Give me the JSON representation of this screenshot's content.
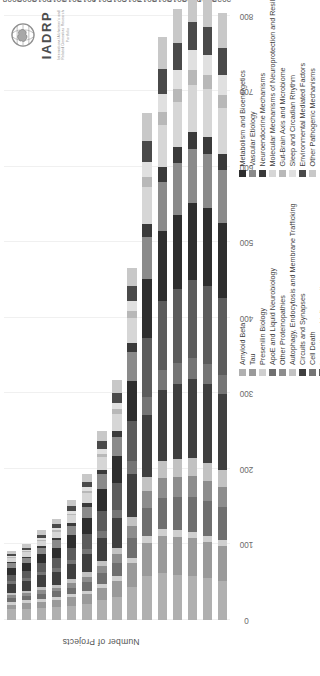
{
  "logo": {
    "name": "IADRP",
    "subtitle": "International Alzheimer's and Related Dementias Research Portfolio",
    "mark": "globe-brain-emblem"
  },
  "chart_data": {
    "type": "bar",
    "orientation": "vertical",
    "stacked": true,
    "title": "",
    "xlabel": "",
    "ylabel": "Number of Projects",
    "ylim": [
      0,
      800
    ],
    "yticks": [
      0,
      100,
      200,
      300,
      400,
      500,
      600,
      700,
      800
    ],
    "grid": true,
    "legend_position": "bottom",
    "categories": [
      "2008",
      "2009",
      "2010",
      "2011",
      "2012",
      "2013",
      "2014",
      "2015",
      "2016",
      "2017",
      "2018",
      "2019",
      "2020",
      "2021",
      "2022"
    ],
    "series": [
      {
        "name": "Amyloid Beta",
        "color": "#b0b0b0",
        "values": [
          14,
          15,
          16,
          17,
          19,
          21,
          26,
          31,
          44,
          58,
          62,
          60,
          58,
          55,
          52
        ]
      },
      {
        "name": "Tau",
        "color": "#9a9a9a",
        "values": [
          6,
          7,
          8,
          9,
          11,
          13,
          17,
          21,
          31,
          44,
          49,
          50,
          50,
          48,
          46
        ]
      },
      {
        "name": "Presenilin Biology",
        "color": "#cfcfcf",
        "values": [
          4,
          4,
          4,
          4,
          4,
          5,
          5,
          6,
          7,
          9,
          9,
          9,
          9,
          8,
          8
        ]
      },
      {
        "name": "ApoE and Liquid Neurobiology",
        "color": "#6f6f6f",
        "values": [
          5,
          6,
          7,
          8,
          9,
          11,
          14,
          18,
          26,
          37,
          42,
          44,
          46,
          46,
          44
        ]
      },
      {
        "name": "Other Proteinopathies",
        "color": "#8d8d8d",
        "values": [
          4,
          4,
          5,
          5,
          6,
          7,
          9,
          11,
          16,
          23,
          26,
          27,
          28,
          27,
          26
        ]
      },
      {
        "name": "Autophagy, Endocytosis and Membrane Trafficking",
        "color": "#c2c2c2",
        "values": [
          3,
          3,
          4,
          4,
          5,
          6,
          7,
          9,
          13,
          19,
          22,
          23,
          24,
          24,
          23
        ]
      },
      {
        "name": "Circuits and Synapses",
        "color": "#3f3f3f",
        "values": [
          12,
          13,
          15,
          17,
          20,
          24,
          31,
          39,
          57,
          82,
          95,
          100,
          104,
          104,
          100
        ]
      },
      {
        "name": "Cell Death",
        "color": "#757575",
        "values": [
          4,
          4,
          5,
          5,
          6,
          7,
          9,
          11,
          16,
          23,
          26,
          27,
          28,
          27,
          26
        ]
      },
      {
        "name": "Immunity and Inflammation",
        "color": "#5c5c5c",
        "values": [
          8,
          9,
          11,
          13,
          16,
          20,
          27,
          35,
          53,
          78,
          92,
          98,
          103,
          104,
          101
        ]
      },
      {
        "name": "Metabolism and Bioenergetics",
        "color": "#2e2e2e",
        "values": [
          9,
          10,
          12,
          14,
          17,
          21,
          28,
          36,
          54,
          79,
          92,
          98,
          102,
          103,
          100
        ]
      },
      {
        "name": "Vascular Etiology",
        "color": "#8a8a8a",
        "values": [
          6,
          7,
          8,
          10,
          12,
          15,
          20,
          26,
          38,
          56,
          65,
          69,
          72,
          72,
          70
        ]
      },
      {
        "name": "Neuroendocrine Mechanisms",
        "color": "#3a3a3a",
        "values": [
          2,
          2,
          3,
          3,
          4,
          5,
          6,
          8,
          12,
          17,
          20,
          21,
          22,
          22,
          21
        ]
      },
      {
        "name": "Molecular Mechanisms of Neuroprotection and Resilience",
        "color": "#d6d6d6",
        "values": [
          5,
          6,
          7,
          8,
          10,
          13,
          17,
          22,
          33,
          48,
          56,
          60,
          63,
          63,
          61
        ]
      },
      {
        "name": "Gut-Brain Axis and Microbiome",
        "color": "#b8b8b8",
        "values": [
          1,
          1,
          1,
          2,
          2,
          3,
          4,
          6,
          9,
          14,
          17,
          18,
          19,
          19,
          18
        ]
      },
      {
        "name": "Sleep and Circadian Rhythm",
        "color": "#e0e0e0",
        "values": [
          2,
          2,
          3,
          3,
          4,
          5,
          7,
          9,
          14,
          20,
          24,
          25,
          27,
          27,
          26
        ]
      },
      {
        "name": "Environmental Mediated Factors",
        "color": "#4a4a4a",
        "values": [
          3,
          3,
          4,
          5,
          6,
          7,
          10,
          13,
          19,
          28,
          33,
          35,
          37,
          37,
          36
        ]
      },
      {
        "name": "Other Pathogenic Mechanisms",
        "color": "#c8c8c8",
        "values": [
          4,
          5,
          6,
          7,
          8,
          10,
          13,
          17,
          25,
          37,
          43,
          46,
          48,
          48,
          46
        ]
      }
    ],
    "totals": [
      92,
      101,
      119,
      134,
      159,
      193,
      250,
      318,
      467,
      672,
      773,
      810,
      840,
      834,
      804
    ]
  },
  "legend": {
    "column_one": [
      "Amyloid Beta",
      "Tau",
      "Presenilin Biology",
      "ApoE and Liquid Neurobiology",
      "Other Proteinopathies",
      "Autophagy, Endocytosis and Membrane Trafficking",
      "Circuits and Synapses",
      "Cell Death",
      "Immunity and Inflammation"
    ],
    "column_two": [
      "Metabolism and Bioenergetics",
      "Vascular Etiology",
      "Neuroendocrine Mechanisms",
      "Molecular Mechanisms of Neuroprotection and Resilience",
      "Gut-Brain Axis and Microbiome",
      "Sleep and Circadian Rhythm",
      "Environmental Mediated Factors",
      "Other Pathogenic Mechanisms"
    ]
  }
}
